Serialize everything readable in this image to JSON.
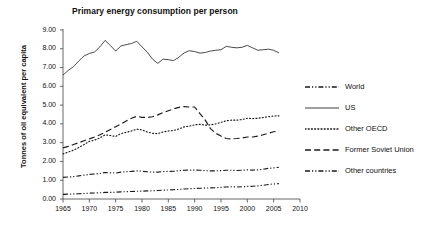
{
  "chart_data": {
    "type": "line",
    "title": "Primary energy consumption per person",
    "xlabel": "",
    "ylabel": "Tonnes of oil equivalent per capita",
    "xlim": [
      1965,
      2010
    ],
    "ylim": [
      0.0,
      9.0
    ],
    "xticks": [
      "1965",
      "1970",
      "1975",
      "1980",
      "1985",
      "1990",
      "1995",
      "2000",
      "2005",
      "2010"
    ],
    "yticks": [
      "0.00",
      "1.00",
      "2.00",
      "3.00",
      "4.00",
      "5.00",
      "6.00",
      "7.00",
      "8.00",
      "9.00"
    ],
    "grid": false,
    "legend_position": "right",
    "x": [
      1965,
      1966,
      1967,
      1968,
      1969,
      1970,
      1971,
      1972,
      1973,
      1974,
      1975,
      1976,
      1977,
      1978,
      1979,
      1980,
      1981,
      1982,
      1983,
      1984,
      1985,
      1986,
      1987,
      1988,
      1989,
      1990,
      1991,
      1992,
      1993,
      1994,
      1995,
      1996,
      1997,
      1998,
      1999,
      2000,
      2001,
      2002,
      2003,
      2004,
      2005,
      2006
    ],
    "series": [
      {
        "name": "World",
        "dash": "dash-dot-dot",
        "color": "#1a1a1a",
        "values": [
          1.15,
          1.17,
          1.19,
          1.23,
          1.27,
          1.31,
          1.33,
          1.36,
          1.41,
          1.39,
          1.38,
          1.43,
          1.45,
          1.47,
          1.5,
          1.48,
          1.45,
          1.43,
          1.43,
          1.46,
          1.47,
          1.48,
          1.51,
          1.53,
          1.54,
          1.54,
          1.53,
          1.51,
          1.5,
          1.5,
          1.51,
          1.53,
          1.53,
          1.52,
          1.53,
          1.55,
          1.54,
          1.55,
          1.58,
          1.63,
          1.66,
          1.69
        ]
      },
      {
        "name": "US",
        "dash": "solid",
        "color": "#2a2a2a",
        "values": [
          6.6,
          6.85,
          7.05,
          7.35,
          7.62,
          7.75,
          7.83,
          8.1,
          8.45,
          8.17,
          7.88,
          8.15,
          8.22,
          8.28,
          8.4,
          8.1,
          7.82,
          7.45,
          7.22,
          7.45,
          7.42,
          7.37,
          7.55,
          7.78,
          7.9,
          7.85,
          7.77,
          7.8,
          7.88,
          7.92,
          7.95,
          8.13,
          8.08,
          8.05,
          8.08,
          8.18,
          8.05,
          7.92,
          7.95,
          7.98,
          7.92,
          7.78
        ]
      },
      {
        "name": "Other OECD",
        "dash": "dotted",
        "color": "#1a1a1a",
        "values": [
          2.4,
          2.5,
          2.6,
          2.74,
          2.9,
          3.07,
          3.14,
          3.25,
          3.42,
          3.38,
          3.33,
          3.48,
          3.55,
          3.62,
          3.72,
          3.68,
          3.57,
          3.5,
          3.48,
          3.57,
          3.62,
          3.65,
          3.73,
          3.84,
          3.88,
          3.95,
          3.98,
          3.93,
          3.95,
          4.0,
          4.08,
          4.17,
          4.2,
          4.2,
          4.23,
          4.3,
          4.28,
          4.3,
          4.34,
          4.38,
          4.42,
          4.43
        ]
      },
      {
        "name": "Former Soviet Union",
        "dash": "long-dash",
        "color": "#1a1a1a",
        "values": [
          2.72,
          2.8,
          2.9,
          3.0,
          3.1,
          3.2,
          3.3,
          3.42,
          3.55,
          3.7,
          3.85,
          4.0,
          4.15,
          4.3,
          4.4,
          4.35,
          4.34,
          4.38,
          4.48,
          4.6,
          4.7,
          4.8,
          4.88,
          4.92,
          4.9,
          4.9,
          4.55,
          4.2,
          3.75,
          3.5,
          3.35,
          3.22,
          3.2,
          3.22,
          3.25,
          3.3,
          3.3,
          3.35,
          3.42,
          3.5,
          3.58,
          3.62
        ]
      },
      {
        "name": "Other countries",
        "dash": "dash-dot-dot",
        "color": "#1a1a1a",
        "values": [
          0.25,
          0.26,
          0.27,
          0.28,
          0.29,
          0.31,
          0.32,
          0.33,
          0.35,
          0.35,
          0.36,
          0.38,
          0.39,
          0.4,
          0.41,
          0.42,
          0.43,
          0.44,
          0.45,
          0.47,
          0.48,
          0.49,
          0.51,
          0.53,
          0.55,
          0.56,
          0.57,
          0.58,
          0.59,
          0.6,
          0.62,
          0.64,
          0.65,
          0.64,
          0.65,
          0.67,
          0.68,
          0.7,
          0.73,
          0.77,
          0.8,
          0.82
        ]
      }
    ]
  },
  "legend": {
    "items": [
      {
        "label": "World"
      },
      {
        "label": "US"
      },
      {
        "label": "Other OECD"
      },
      {
        "label": "Former Soviet Union"
      },
      {
        "label": "Other countries"
      }
    ]
  }
}
